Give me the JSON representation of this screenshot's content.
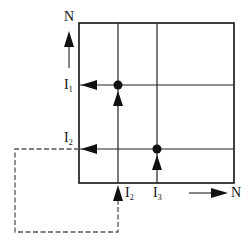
{
  "diagram": {
    "type": "grid flow diagram",
    "colors": {
      "line": "#111111",
      "dashed": "#555555",
      "background": "#ffffff"
    },
    "axes": {
      "vertical_label": "N",
      "horizontal_label": "N"
    },
    "labels": {
      "i1": {
        "main": "I",
        "sub": "1"
      },
      "i2_left": {
        "main": "I",
        "sub": "2"
      },
      "i2_bottom": {
        "main": "I",
        "sub": "2"
      },
      "i3": {
        "main": "I",
        "sub": "3"
      }
    },
    "nodes": [
      {
        "name": "node-1",
        "x": 118,
        "y": 85
      },
      {
        "name": "node-2",
        "x": 157,
        "y": 149
      }
    ],
    "feedback_path": "dashed loop from I2 (left) back to I2 (bottom)"
  }
}
